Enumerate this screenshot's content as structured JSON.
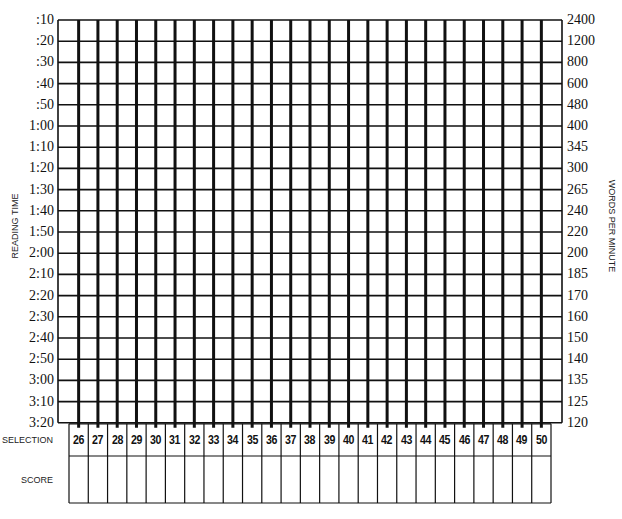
{
  "chart_data": {
    "type": "table",
    "title": "",
    "ylabel_left": "READING TIME",
    "ylabel_right": "WORDS PER MINUTE",
    "reading_time_ticks": [
      ":10",
      ":20",
      ":30",
      ":40",
      ":50",
      "1:00",
      "1:10",
      "1:20",
      "1:30",
      "1:40",
      "1:50",
      "2:00",
      "2:10",
      "2:20",
      "2:30",
      "2:40",
      "2:50",
      "3:00",
      "3:10",
      "3:20"
    ],
    "words_per_minute_ticks": [
      "2400",
      "1200",
      "800",
      "600",
      "480",
      "400",
      "345",
      "300",
      "265",
      "240",
      "220",
      "200",
      "185",
      "170",
      "160",
      "150",
      "140",
      "135",
      "125",
      "120"
    ],
    "selections": [
      "26",
      "27",
      "28",
      "29",
      "30",
      "31",
      "32",
      "33",
      "34",
      "35",
      "36",
      "37",
      "38",
      "39",
      "40",
      "41",
      "42",
      "43",
      "44",
      "45",
      "46",
      "47",
      "48",
      "49",
      "50"
    ],
    "scores": [
      "",
      "",
      "",
      "",
      "",
      "",
      "",
      "",
      "",
      "",
      "",
      "",
      "",
      "",
      "",
      "",
      "",
      "",
      "",
      "",
      "",
      "",
      "",
      "",
      ""
    ],
    "plotted_points": [],
    "grid": true
  },
  "labels": {
    "selection_row": "SELECTION",
    "score_row": "SCORE"
  },
  "colors": {
    "line": "#111111",
    "background": "#ffffff"
  }
}
